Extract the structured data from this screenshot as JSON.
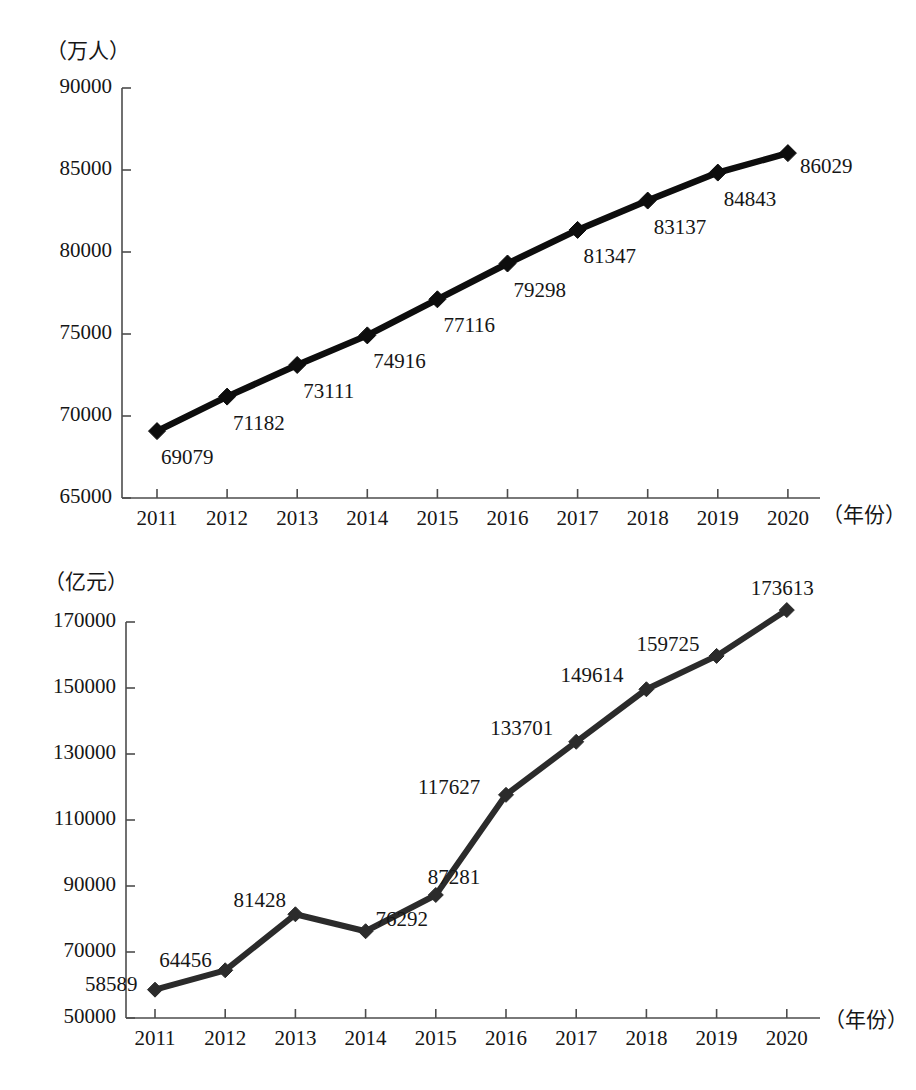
{
  "figure": {
    "panels": [
      {
        "id": "population",
        "unit_label": "（万人）",
        "x_axis_name": "（年份）",
        "y_ticks": [
          "65000",
          "70000",
          "75000",
          "80000",
          "85000",
          "90000"
        ],
        "x_ticks": [
          "2011",
          "2012",
          "2013",
          "2014",
          "2015",
          "2016",
          "2017",
          "2018",
          "2019",
          "2020"
        ],
        "point_labels": [
          "69079",
          "71182",
          "73111",
          "74916",
          "77116",
          "79298",
          "81347",
          "83137",
          "84843",
          "86029"
        ]
      },
      {
        "id": "gdp",
        "unit_label": "（亿元）",
        "x_axis_name": "（年份）",
        "y_ticks": [
          "50000",
          "70000",
          "90000",
          "110000",
          "130000",
          "150000",
          "170000"
        ],
        "x_ticks": [
          "2011",
          "2012",
          "2013",
          "2014",
          "2015",
          "2016",
          "2017",
          "2018",
          "2019",
          "2020"
        ],
        "point_labels": [
          "58589",
          "64456",
          "81428",
          "76292",
          "87281",
          "117627",
          "133701",
          "149614",
          "159725",
          "173613"
        ]
      }
    ]
  },
  "chart_data": [
    {
      "type": "line",
      "id": "population",
      "title": "",
      "xlabel": "（年份）",
      "ylabel": "（万人）",
      "x": [
        2011,
        2012,
        2013,
        2014,
        2015,
        2016,
        2017,
        2018,
        2019,
        2020
      ],
      "categories": [
        "2011",
        "2012",
        "2013",
        "2014",
        "2015",
        "2016",
        "2017",
        "2018",
        "2019",
        "2020"
      ],
      "values": [
        69079,
        71182,
        73111,
        74916,
        77116,
        79298,
        81347,
        83137,
        84843,
        86029
      ],
      "ylim": [
        65000,
        90000
      ],
      "ytick_step": 5000,
      "yticks": [
        65000,
        70000,
        75000,
        80000,
        85000,
        90000
      ],
      "grid": false,
      "legend": "none",
      "marker": "diamond",
      "line_color": "#000000",
      "line_width": 5,
      "data_labels": true
    },
    {
      "type": "line",
      "id": "gdp",
      "title": "",
      "xlabel": "（年份）",
      "ylabel": "（亿元）",
      "x": [
        2011,
        2012,
        2013,
        2014,
        2015,
        2016,
        2017,
        2018,
        2019,
        2020
      ],
      "categories": [
        "2011",
        "2012",
        "2013",
        "2014",
        "2015",
        "2016",
        "2017",
        "2018",
        "2019",
        "2020"
      ],
      "values": [
        58589,
        64456,
        81428,
        76292,
        87281,
        117627,
        133701,
        149614,
        159725,
        173613
      ],
      "ylim": [
        50000,
        170000
      ],
      "ytick_step": 20000,
      "yticks": [
        50000,
        70000,
        90000,
        110000,
        130000,
        150000,
        170000
      ],
      "grid": false,
      "legend": "none",
      "marker": "diamond",
      "line_color": "#2b2b2b",
      "line_width": 5,
      "data_labels": true
    }
  ]
}
